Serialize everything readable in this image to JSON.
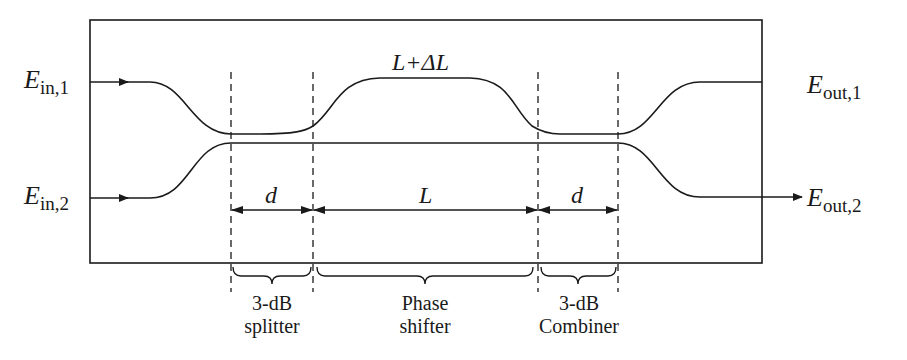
{
  "diagram": {
    "colors": {
      "line": "#1a1a1a",
      "background": "#ffffff"
    },
    "ports": {
      "in1": {
        "symbol": "E",
        "subscript": "in,1"
      },
      "in2": {
        "symbol": "E",
        "subscript": "in,2"
      },
      "out1": {
        "symbol": "E",
        "subscript": "out,1"
      },
      "out2": {
        "symbol": "E",
        "subscript": "out,2"
      }
    },
    "arm_label": "L+ΔL",
    "dimensions": {
      "splitter_length": "d",
      "phase_shifter_length": "L",
      "combiner_length": "d"
    },
    "sections": [
      {
        "line1": "3-dB",
        "line2": "splitter"
      },
      {
        "line1": "Phase",
        "line2": "shifter"
      },
      {
        "line1": "3-dB",
        "line2": "Combiner"
      }
    ]
  }
}
